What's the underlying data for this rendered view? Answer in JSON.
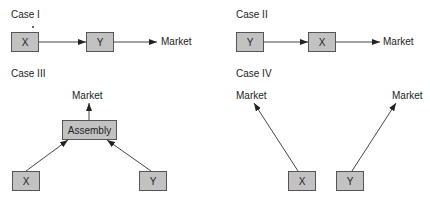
{
  "cases": [
    {
      "title": "Case I",
      "nodes": [
        "X",
        "Y"
      ],
      "target": "Market",
      "flow": "X -> Y -> Market"
    },
    {
      "title": "Case II",
      "nodes": [
        "Y",
        "X"
      ],
      "target": "Market",
      "flow": "Y -> X -> Market"
    },
    {
      "title": "Case III",
      "nodes": [
        "X",
        "Y"
      ],
      "assembly": "Assembly",
      "target": "Market",
      "flow": "X, Y -> Assembly -> Market"
    },
    {
      "title": "Case IV",
      "nodes": [
        "X",
        "Y"
      ],
      "targets": [
        "Market",
        "Market"
      ],
      "flow": "X -> Market; Y -> Market"
    }
  ],
  "colors": {
    "box_fill": "#c2c2c2",
    "box_border": "#555555",
    "arrow": "#333333"
  }
}
